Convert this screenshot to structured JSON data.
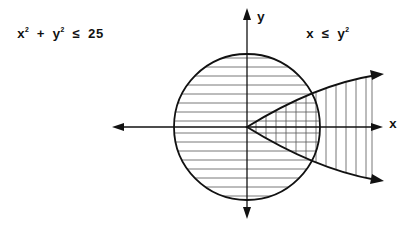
{
  "labels": {
    "circle_inequality": {
      "a": "x",
      "b": " + y",
      "c": " ≤ 25",
      "exp": "2"
    },
    "parabola_inequality": {
      "a": "x ≤ y",
      "exp": "2"
    },
    "x_axis": "x",
    "y_axis": "y"
  },
  "geometry": {
    "origin": [
      247,
      127
    ],
    "circle_radius": 73,
    "stroke": "#111111"
  }
}
